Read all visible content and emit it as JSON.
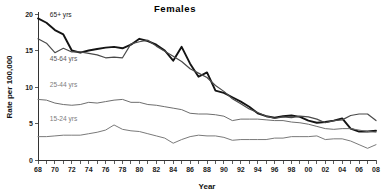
{
  "chart_data": {
    "type": "line",
    "title": "Females",
    "xlabel": "Year",
    "ylabel": "Rate per 100,000",
    "ylim": [
      0,
      20
    ],
    "yticks": [
      0,
      5,
      10,
      15,
      20
    ],
    "xlim": [
      68,
      108
    ],
    "grid": false,
    "legend": "inline-labels",
    "x": [
      68,
      69,
      70,
      71,
      72,
      73,
      74,
      75,
      76,
      77,
      78,
      79,
      80,
      81,
      82,
      83,
      84,
      85,
      86,
      87,
      88,
      89,
      90,
      91,
      92,
      93,
      94,
      95,
      96,
      97,
      98,
      99,
      100,
      101,
      102,
      103,
      104,
      105,
      106,
      107,
      108
    ],
    "xticklabels": [
      "68",
      "",
      "70",
      "",
      "72",
      "",
      "74",
      "",
      "76",
      "",
      "78",
      "",
      "80",
      "",
      "82",
      "",
      "84",
      "",
      "86",
      "",
      "88",
      "",
      "90",
      "",
      "92",
      "",
      "94",
      "",
      "96",
      "",
      "98",
      "",
      "00",
      "",
      "02",
      "",
      "04",
      "",
      "06",
      "",
      "08"
    ],
    "series": [
      {
        "name": "65+ yrs",
        "label": "65+ yrs",
        "color": "#141414",
        "linewidth": 1.9,
        "values": [
          19.4,
          18.8,
          17.8,
          17.2,
          15.0,
          14.7,
          15.0,
          15.2,
          15.4,
          15.5,
          15.3,
          15.8,
          16.6,
          16.3,
          15.8,
          15.0,
          13.6,
          15.5,
          13.2,
          11.4,
          12.0,
          9.5,
          9.2,
          8.6,
          8.0,
          7.3,
          6.4,
          6.0,
          5.8,
          6.0,
          6.1,
          5.9,
          5.4,
          5.1,
          5.2,
          5.4,
          5.7,
          4.3,
          3.9,
          3.9,
          4.0
        ]
      },
      {
        "name": "45-64 yrs",
        "label": "45-64 yrs",
        "color": "#4a4a4a",
        "linewidth": 1.2,
        "values": [
          16.6,
          16.0,
          14.7,
          15.3,
          14.8,
          14.8,
          14.6,
          14.4,
          14.0,
          14.1,
          14.0,
          15.9,
          16.2,
          16.4,
          15.6,
          14.9,
          14.2,
          13.5,
          12.5,
          11.9,
          11.3,
          10.2,
          9.4,
          8.4,
          7.7,
          7.0,
          6.5,
          6.0,
          5.7,
          5.9,
          5.8,
          6.0,
          5.9,
          5.6,
          5.1,
          5.4,
          5.5,
          6.1,
          6.3,
          6.3,
          5.4
        ]
      },
      {
        "name": "25-44 yrs",
        "label": "25-44 yrs",
        "color": "#6e6e6e",
        "linewidth": 1.0,
        "values": [
          8.3,
          8.2,
          7.8,
          7.6,
          7.5,
          7.6,
          7.9,
          7.8,
          8.0,
          8.2,
          8.3,
          7.9,
          7.9,
          7.6,
          7.5,
          7.3,
          7.1,
          6.9,
          6.4,
          6.3,
          6.3,
          6.2,
          6.0,
          5.4,
          5.6,
          5.6,
          5.6,
          5.5,
          5.4,
          5.4,
          5.2,
          5.1,
          4.9,
          4.6,
          4.3,
          4.2,
          4.3,
          4.3,
          4.1,
          3.9,
          3.8
        ]
      },
      {
        "name": "15-24 yrs",
        "label": "15-24 yrs",
        "color": "#7a7a7a",
        "linewidth": 1.0,
        "values": [
          3.2,
          3.2,
          3.3,
          3.4,
          3.4,
          3.4,
          3.6,
          3.8,
          4.1,
          4.8,
          4.2,
          4.0,
          3.9,
          3.6,
          3.3,
          3.0,
          2.3,
          2.8,
          3.2,
          3.4,
          3.3,
          3.3,
          3.1,
          2.7,
          2.8,
          2.8,
          2.8,
          2.8,
          3.0,
          3.0,
          3.2,
          3.2,
          3.2,
          3.3,
          2.8,
          2.9,
          2.9,
          2.6,
          2.1,
          1.6,
          2.1
        ]
      }
    ],
    "annotations": [
      {
        "name": "label-65plus",
        "text": "65+ yrs",
        "x": 69.4,
        "y": 19.6,
        "color": "#1b1b1b"
      },
      {
        "name": "label-45-64",
        "text": "45-64 yrs",
        "x": 69.4,
        "y": 13.6,
        "color": "#5a5a5a"
      },
      {
        "name": "label-25-44",
        "text": "25-44 yrs",
        "x": 69.4,
        "y": 10.0,
        "color": "#7d7d7d"
      },
      {
        "name": "label-15-24",
        "text": "15-24 yrs",
        "x": 69.4,
        "y": 5.3,
        "color": "#7d7d7d"
      }
    ]
  }
}
